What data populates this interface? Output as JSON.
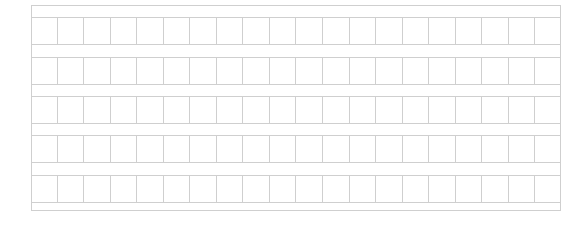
{
  "sheet": {
    "type": "manuscript-grid",
    "rows": 5,
    "columns": 20,
    "row_tops": [
      11,
      51,
      90,
      129,
      169
    ],
    "line_color": "#cfcfcf",
    "cells": []
  }
}
